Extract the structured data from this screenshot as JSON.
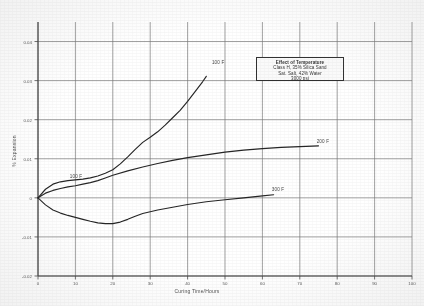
{
  "chart_data": {
    "type": "line",
    "title": "Effect of Temperature",
    "xlabel": "Curing Time/Hours",
    "ylabel": "% Expansion",
    "xlim": [
      0,
      100
    ],
    "ylim": [
      -0.02,
      0.045
    ],
    "xticks": [
      0,
      10,
      20,
      30,
      40,
      50,
      60,
      70,
      80,
      90,
      100
    ],
    "xticklabels": [
      "0",
      "10",
      "20",
      "30",
      "40",
      "50",
      "60",
      "70",
      "80",
      "90",
      "100"
    ],
    "yticks": [
      -0.02,
      -0.01,
      0,
      0.01,
      0.02,
      0.03,
      0.04
    ],
    "yticklabels": [
      "-0.02",
      "-0.01",
      "0",
      "0.01",
      "0.02",
      "0.03",
      "0.04"
    ],
    "grid": true,
    "legend_position": "inside-top-right",
    "annotations": [
      {
        "text": "100 F",
        "x": 8.5,
        "y": 0.0042
      },
      {
        "text": "100 F",
        "x": 46.5,
        "y": 0.0335
      },
      {
        "text": "200 F",
        "x": 74.5,
        "y": 0.0133
      },
      {
        "text": "300 F",
        "x": 62.5,
        "y": 0.0011
      }
    ],
    "series": [
      {
        "name": "100 F",
        "x": [
          0,
          2,
          4,
          6,
          8,
          10,
          12,
          14,
          16,
          18,
          20,
          22,
          24,
          26,
          28,
          30,
          32,
          34,
          36,
          38,
          40,
          42,
          44,
          45
        ],
        "values": [
          0.0,
          0.0022,
          0.0035,
          0.0041,
          0.0044,
          0.0046,
          0.0048,
          0.0051,
          0.0056,
          0.0063,
          0.0072,
          0.0087,
          0.0105,
          0.0124,
          0.0142,
          0.0155,
          0.0169,
          0.0186,
          0.0205,
          0.0224,
          0.0247,
          0.0272,
          0.0297,
          0.0311
        ]
      },
      {
        "name": "200 F",
        "x": [
          0,
          2,
          4,
          6,
          8,
          10,
          12,
          14,
          16,
          18,
          20,
          24,
          28,
          32,
          36,
          40,
          45,
          50,
          55,
          60,
          65,
          70,
          75
        ],
        "values": [
          0.0,
          0.0012,
          0.0019,
          0.0024,
          0.0028,
          0.0031,
          0.0035,
          0.0039,
          0.0044,
          0.0051,
          0.0058,
          0.0069,
          0.0079,
          0.0088,
          0.0096,
          0.0103,
          0.011,
          0.0117,
          0.0122,
          0.0126,
          0.0129,
          0.0131,
          0.0133
        ]
      },
      {
        "name": "300 F",
        "x": [
          0,
          2,
          4,
          6,
          8,
          10,
          12,
          14,
          16,
          18,
          20,
          22,
          24,
          26,
          28,
          32,
          36,
          40,
          45,
          50,
          55,
          60,
          63
        ],
        "values": [
          0.0,
          -0.0018,
          -0.0031,
          -0.0039,
          -0.0045,
          -0.005,
          -0.0055,
          -0.006,
          -0.0064,
          -0.0066,
          -0.0066,
          -0.0062,
          -0.0055,
          -0.0047,
          -0.004,
          -0.0031,
          -0.0024,
          -0.0017,
          -0.001,
          -0.0005,
          0.0,
          0.0005,
          0.0008
        ]
      }
    ]
  },
  "legend": {
    "lines": [
      "Effect of Temperature",
      "Class H, 35% Silica Sand",
      "Sat. Salt, 42% Water",
      "3000 psi"
    ]
  }
}
